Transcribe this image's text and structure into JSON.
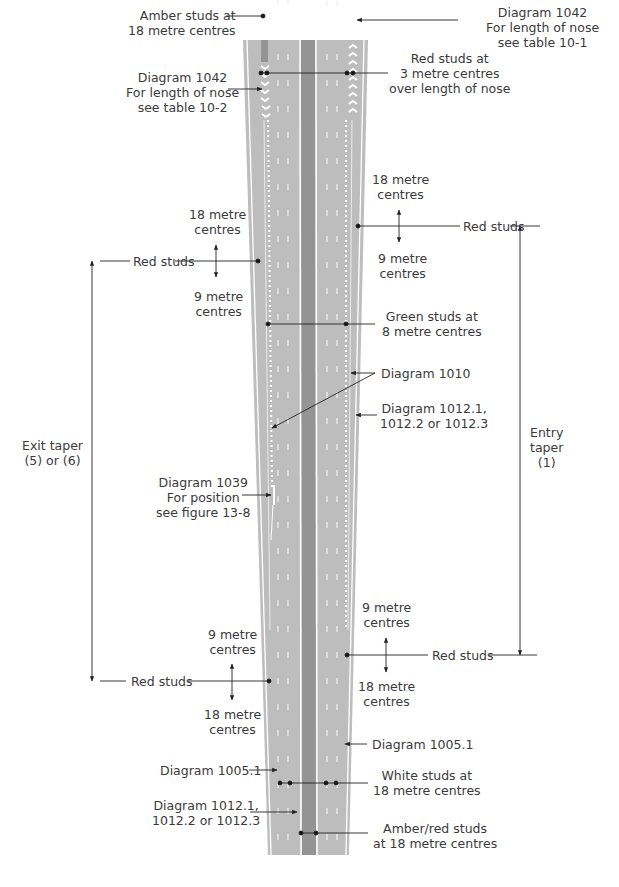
{
  "figure": {
    "colors": {
      "road": "#b8b8b8",
      "central_reservation": "#8f8f8f",
      "line": "#ffffff",
      "leader": "#222222",
      "text": "#3a3a3a"
    },
    "labels": {
      "amber_studs_top": [
        "Amber studs at",
        "18 metre centres"
      ],
      "diagram_1042_right": [
        "Diagram 1042",
        "For length of nose",
        "see table 10-1"
      ],
      "diagram_1042_left": [
        "Diagram 1042",
        "For length of nose",
        "see table 10-2"
      ],
      "red_studs_nose": [
        "Red studs at",
        "3 metre centres",
        "over length of nose"
      ],
      "right_upper_18": [
        "18 metre",
        "centres"
      ],
      "right_upper_red": "Red studs",
      "right_upper_9": [
        "9 metre",
        "centres"
      ],
      "left_upper_18": [
        "18 metre",
        "centres"
      ],
      "left_upper_red": "Red studs",
      "left_upper_9": [
        "9 metre",
        "centres"
      ],
      "green_studs": [
        "Green studs at",
        "8 metre centres"
      ],
      "diagram_1010": "Diagram 1010",
      "diagram_1012_right": [
        "Diagram 1012.1,",
        "1012.2 or 1012.3"
      ],
      "entry_taper": [
        "Entry",
        "taper",
        "(1)"
      ],
      "exit_taper": [
        "Exit taper",
        "(5) or (6)"
      ],
      "diagram_1039": [
        "Diagram 1039",
        "For position",
        "see figure 13-8"
      ],
      "right_lower_9": [
        "9 metre",
        "centres"
      ],
      "right_lower_red": "Red studs",
      "right_lower_18": [
        "18 metre",
        "centres"
      ],
      "left_lower_9": [
        "9 metre",
        "centres"
      ],
      "left_lower_red": "Red studs",
      "left_lower_18": [
        "18 metre",
        "centres"
      ],
      "diagram_1005_right": "Diagram 1005.1",
      "diagram_1005_left": "Diagram 1005.1",
      "white_studs": [
        "White studs at",
        "18 metre centres"
      ],
      "diagram_1012_left": [
        "Diagram 1012.1,",
        "1012.2 or 1012.3"
      ],
      "amber_red_studs": [
        "Amber/red studs",
        "at 18 metre centres"
      ]
    }
  }
}
